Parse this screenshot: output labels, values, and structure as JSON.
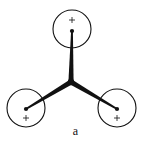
{
  "figure": {
    "caption": "a",
    "colors": {
      "stroke": "#111111",
      "background": "#ffffff"
    },
    "junction": {
      "x": 71,
      "y": 82
    },
    "nodes": [
      {
        "name": "top",
        "circle_cx": 72,
        "circle_cy": 29,
        "r": 19,
        "dot_x": 72,
        "dot_y": 31,
        "plus_x": 72,
        "plus_y": 20,
        "label": "+"
      },
      {
        "name": "bottom-left",
        "circle_cx": 26,
        "circle_cy": 108,
        "r": 19,
        "dot_x": 26,
        "dot_y": 109,
        "plus_x": 26,
        "plus_y": 118,
        "label": "+"
      },
      {
        "name": "bottom-right",
        "circle_cx": 117,
        "circle_cy": 108,
        "r": 19,
        "dot_x": 117,
        "dot_y": 109,
        "plus_x": 117,
        "plus_y": 118,
        "label": "+"
      }
    ]
  }
}
